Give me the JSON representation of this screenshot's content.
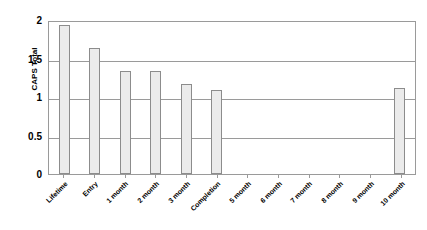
{
  "chart_data": {
    "type": "bar",
    "title": "",
    "xlabel": "",
    "ylabel": "CAPS Total",
    "ylim": [
      0,
      2
    ],
    "yticks": [
      "0",
      "0.5",
      "1",
      "1.5",
      "2"
    ],
    "ytick_values": [
      0,
      0.5,
      1,
      1.5,
      2
    ],
    "gridlines": [
      0.5,
      1,
      1.5
    ],
    "grid": true,
    "legend": "none",
    "categories": [
      "Lifetime",
      "Entry",
      "1 month",
      "2 month",
      "3 month",
      "Completion",
      "5 month",
      "6 month",
      "7 month",
      "8 month",
      "9 month",
      "10 month"
    ],
    "values": [
      1.96,
      1.66,
      1.35,
      1.36,
      1.19,
      1.1,
      0,
      0,
      0,
      0,
      0,
      1.13
    ],
    "bar_fill_color": "#ebebeb",
    "bar_border_color": "#8c8c8c",
    "axis_color": "#9a9a9a",
    "text_color": "#000000",
    "background_color": "#ffffff"
  }
}
